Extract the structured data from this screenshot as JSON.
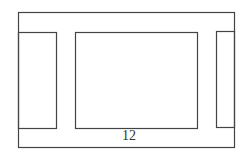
{
  "diagram": {
    "stroke_color": "#333333",
    "background": "#ffffff",
    "outer_frame": {
      "x": 18,
      "y": 13,
      "w": 216,
      "h": 135
    },
    "panels": [
      {
        "name": "left-panel",
        "x": 19,
        "y": 32,
        "w": 38,
        "h": 96
      },
      {
        "name": "center-panel",
        "x": 75,
        "y": 32,
        "w": 122,
        "h": 96
      },
      {
        "name": "right-panel",
        "x": 216,
        "y": 31,
        "w": 18,
        "h": 96
      }
    ],
    "label": {
      "text": "12",
      "x": 129,
      "y": 136
    }
  }
}
